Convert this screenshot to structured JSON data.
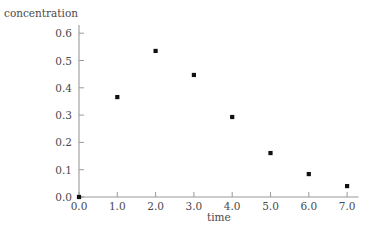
{
  "chart_data": {
    "type": "scatter",
    "title": "",
    "xlabel": "time",
    "ylabel": "concentration",
    "x": [
      0.0,
      1.0,
      2.0,
      3.0,
      4.0,
      5.0,
      6.0,
      7.0
    ],
    "values": [
      0.0,
      0.366,
      0.535,
      0.447,
      0.293,
      0.161,
      0.084,
      0.04
    ],
    "points": [
      {
        "x": 0.0,
        "y": 0.0
      },
      {
        "x": 1.0,
        "y": 0.366
      },
      {
        "x": 2.0,
        "y": 0.535
      },
      {
        "x": 3.0,
        "y": 0.447
      },
      {
        "x": 4.0,
        "y": 0.293
      },
      {
        "x": 5.0,
        "y": 0.161
      },
      {
        "x": 6.0,
        "y": 0.084
      },
      {
        "x": 7.0,
        "y": 0.04
      }
    ],
    "xlim": [
      0.0,
      7.3
    ],
    "ylim": [
      0.0,
      0.63
    ],
    "xticks": [
      0.0,
      1.0,
      2.0,
      3.0,
      4.0,
      5.0,
      6.0,
      7.0
    ],
    "yticks": [
      0.0,
      0.1,
      0.2,
      0.3,
      0.4,
      0.5,
      0.6
    ],
    "xtick_labels": [
      "0.0",
      "1.0",
      "2.0",
      "3.0",
      "4.0",
      "5.0",
      "6.0",
      "7.0"
    ],
    "ytick_labels": [
      "0.0",
      "0.1",
      "0.2",
      "0.3",
      "0.4",
      "0.5",
      "0.6"
    ],
    "grid": false,
    "legend": null,
    "legend_position": "none",
    "marker": "filled-square-dot",
    "marker_color": "#111111",
    "axis_color": "#9a9a9a",
    "text_color": "#4a4a4a",
    "background": "#ffffff"
  }
}
